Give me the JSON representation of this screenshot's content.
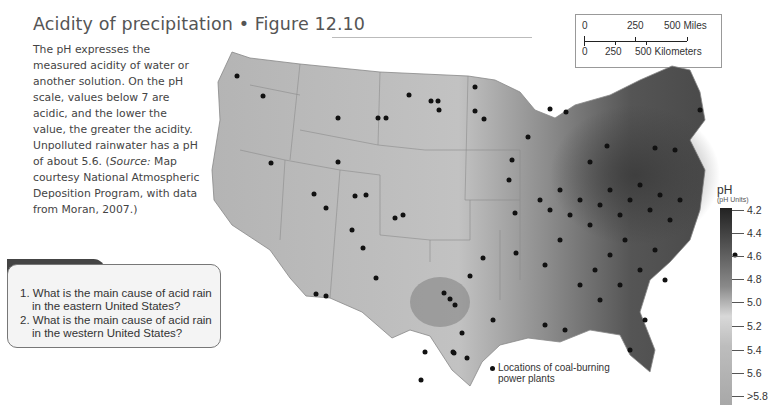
{
  "figure": {
    "title": "Acidity of precipitation  •  Figure 12.10",
    "caption_parts": [
      "The pH expresses the measured acidity of water or another solution. On the pH scale, values below 7 are acidic, and the lower the value, the greater the acidity. Unpolluted rainwater has a pH of about 5.6. (",
      "Source:",
      " Map courtesy National Atmospheric Deposition Program, with data from Moran, 2007.)"
    ]
  },
  "scale_bar": {
    "miles": {
      "labels": [
        "0",
        "250",
        "500 Miles"
      ]
    },
    "km": {
      "labels": [
        "0",
        "250",
        "500 Kilometers"
      ]
    }
  },
  "ask_yourself": {
    "heading": "Ask Yourself",
    "questions": [
      "1. What is the main cause of acid rain in the eastern United States?",
      "2. What is the main cause of acid rain in the western United States?"
    ]
  },
  "legend": {
    "title": "pH",
    "units": "(pH Units)",
    "values": [
      "4.2",
      "4.4",
      "4.6",
      "4.8",
      "5.0",
      "5.2",
      "5.4",
      "5.6",
      ">5.8"
    ],
    "power_plants_label_line1": "Locations of coal-burning",
    "power_plants_label_line2": "power plants"
  },
  "colors": {
    "most_acidic": "#222222",
    "least_acidic": "#a8a8a8",
    "dot": "#111111"
  }
}
